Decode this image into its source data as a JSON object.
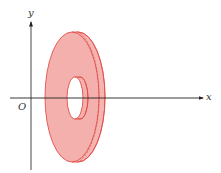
{
  "figure": {
    "type": "3D solid of revolution diagram (washer / annulus disk)",
    "axes": {
      "x_label": "x",
      "y_label": "y",
      "origin_label": "O"
    },
    "colors": {
      "fill": "#f4b0ad",
      "edge": "#e0504a",
      "axis": "#222222",
      "background": "#ffffff"
    },
    "shape": {
      "name": "washer",
      "description": "Thin disk with a central hole, perpendicular to the x-axis, centered on the x-axis"
    }
  }
}
